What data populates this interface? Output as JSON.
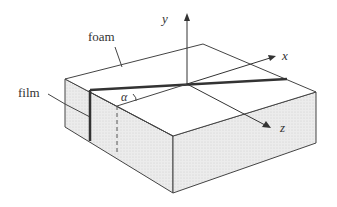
{
  "diagram": {
    "labels": {
      "foam": "foam",
      "film": "film",
      "angle": "α",
      "x_axis": "x",
      "y_axis": "y",
      "z_axis": "z"
    },
    "colors": {
      "stroke": "#333333",
      "film_stroke": "#3a3a3a",
      "side_fill": "#e6e6e6",
      "top_fill": "#ffffff"
    }
  }
}
